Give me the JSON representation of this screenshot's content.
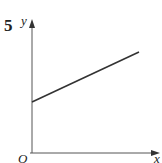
{
  "question_number": "5",
  "axes": {
    "x_label": "x",
    "y_label": "y",
    "origin_label": "O"
  },
  "line": {
    "description": "straight line with positive gradient and positive y-intercept",
    "start": {
      "px": 32,
      "py": 102
    },
    "end": {
      "px": 139,
      "py": 52
    },
    "color": "#333333"
  },
  "colors": {
    "axis": "#555555",
    "line": "#333333",
    "background": "#ffffff"
  }
}
